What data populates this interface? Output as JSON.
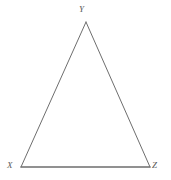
{
  "figure": {
    "type": "triangle-diagram",
    "background_color": "#ffffff",
    "stroke_color": "#6e6e6e",
    "label_color": "#5a5a5a",
    "vertices": [
      {
        "name": "X",
        "label": "X",
        "x": 21,
        "y": 167
      },
      {
        "name": "Y",
        "label": "Y",
        "x": 86,
        "y": 22
      },
      {
        "name": "Z",
        "label": "Z",
        "x": 150,
        "y": 167
      }
    ],
    "edges": [
      {
        "name": "edge-XY",
        "from": "X",
        "to": "Y",
        "stroke_width": 1
      },
      {
        "name": "edge-YZ",
        "from": "Y",
        "to": "Z",
        "stroke_width": 1
      },
      {
        "name": "edge-XZ",
        "from": "X",
        "to": "Z",
        "stroke_width": 1.4
      }
    ],
    "labels": {
      "apex": "Y",
      "bottom_left": "X",
      "bottom_right": "Z"
    }
  }
}
